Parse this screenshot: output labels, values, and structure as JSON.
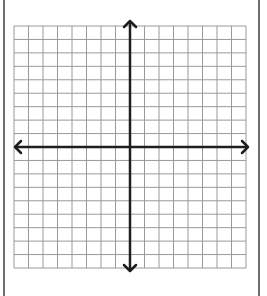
{
  "diagram": {
    "type": "coordinate-plane",
    "title": "",
    "grid": {
      "columns": 16,
      "rows": 18,
      "left": 14,
      "top": 26,
      "right": 246,
      "bottom": 268,
      "line_color": "#9a9a9a",
      "line_width": 1
    },
    "axes": {
      "origin_x": 130,
      "origin_y": 147,
      "x_axis": {
        "from": 15,
        "to": 248,
        "arrows": "both"
      },
      "y_axis": {
        "from": 21,
        "to": 271,
        "arrows": "both"
      },
      "color": "#1e1e1e",
      "line_width": 2.5
    },
    "frame": {
      "left_x": 3,
      "right_x": 259,
      "color": "#6e6e6e"
    },
    "labels": []
  }
}
